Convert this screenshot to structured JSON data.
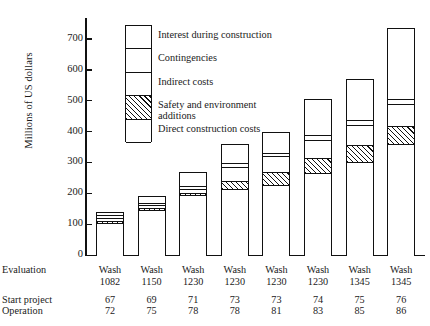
{
  "chart_data": {
    "type": "bar",
    "subtype": "stacked-bar",
    "title": "",
    "xlabel": "",
    "ylabel": "Millions of US dollars",
    "ylim": [
      0,
      760
    ],
    "yticks": [
      0,
      100,
      200,
      300,
      400,
      500,
      600,
      700
    ],
    "ytick_labels": [
      "0",
      "100",
      "200",
      "300",
      "400",
      "500",
      "600",
      "700"
    ],
    "grid": false,
    "legend_position": "inside-upper-left",
    "categories": [
      "Wash 1082",
      "Wash 1150",
      "Wash 1230",
      "Wash 1230",
      "Wash 1230",
      "Wash 1230",
      "Wash 1345",
      "Wash 1345"
    ],
    "series": [
      {
        "name": "Direct construction costs",
        "fill": "white",
        "values": [
          105,
          145,
          193,
          215,
          228,
          265,
          300,
          360
        ]
      },
      {
        "name": "Safety and environment additions",
        "fill": "hatched",
        "values": [
          6,
          6,
          8,
          25,
          42,
          48,
          55,
          58
        ]
      },
      {
        "name": "Indirect costs",
        "fill": "white",
        "values": [
          10,
          10,
          14,
          45,
          50,
          60,
          65,
          70
        ]
      },
      {
        "name": "Contingencies",
        "fill": "white",
        "values": [
          8,
          8,
          10,
          14,
          12,
          15,
          18,
          18
        ]
      },
      {
        "name": "Interest during construction",
        "fill": "white",
        "values": [
          11,
          21,
          45,
          61,
          68,
          117,
          132,
          229
        ]
      }
    ],
    "totals": [
      140,
      190,
      270,
      360,
      400,
      505,
      570,
      735
    ]
  },
  "y_axis": {
    "title": "Millions of US dollars",
    "ticks": [
      {
        "value": 700,
        "label": "700"
      },
      {
        "value": 600,
        "label": "600"
      },
      {
        "value": 500,
        "label": "500"
      },
      {
        "value": 400,
        "label": "400"
      },
      {
        "value": 300,
        "label": "300"
      },
      {
        "value": 200,
        "label": "200"
      },
      {
        "value": 100,
        "label": "100"
      },
      {
        "value": 0,
        "label": "0"
      }
    ]
  },
  "legend": {
    "items": [
      {
        "label": "Interest during construction",
        "fill": "white"
      },
      {
        "label": "Contingencies",
        "fill": "white"
      },
      {
        "label": "Indirect costs",
        "fill": "white"
      },
      {
        "label": "Safety and environment",
        "label2": "additions",
        "fill": "hatched"
      },
      {
        "label": "Direct construction costs",
        "fill": "white"
      }
    ]
  },
  "table": {
    "rows": [
      {
        "label": "Evaluation",
        "values": [
          "Wash",
          "Wash",
          "Wash",
          "Wash",
          "Wash",
          "Wash",
          "Wash",
          "Wash"
        ]
      },
      {
        "label": "",
        "values": [
          "1082",
          "1150",
          "1230",
          "1230",
          "1230",
          "1230",
          "1345",
          "1345"
        ]
      },
      {
        "label": "Start project",
        "values": [
          "67",
          "69",
          "71",
          "73",
          "73",
          "74",
          "75",
          "76"
        ]
      },
      {
        "label": "Operation",
        "values": [
          "72",
          "75",
          "78",
          "78",
          "81",
          "83",
          "85",
          "86"
        ]
      }
    ]
  },
  "colors": {
    "ink": "#111111",
    "paper": "#ffffff"
  }
}
